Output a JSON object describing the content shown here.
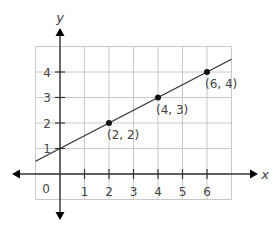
{
  "chart_data": {
    "type": "line",
    "title": "",
    "xlabel": "x",
    "ylabel": "y",
    "xlim": [
      -1,
      7
    ],
    "ylim": [
      -1,
      5
    ],
    "grid": true,
    "origin_label": "0",
    "x_ticks": [
      "1",
      "2",
      "3",
      "4",
      "5",
      "6"
    ],
    "y_ticks": [
      "1",
      "2",
      "3",
      "4"
    ],
    "series": [
      {
        "name": "line",
        "x": [
          -1,
          7
        ],
        "y": [
          0.5,
          4.5
        ],
        "slope": 0.5,
        "intercept": 1
      }
    ],
    "points": [
      {
        "x": 2,
        "y": 2,
        "label": "(2, 2)"
      },
      {
        "x": 4,
        "y": 3,
        "label": "(4, 3)"
      },
      {
        "x": 6,
        "y": 4,
        "label": "(6, 4)"
      }
    ],
    "colors": {
      "grid": "#c8c8c8",
      "axis": "#333333",
      "line": "#333333",
      "point": "#111111"
    }
  }
}
